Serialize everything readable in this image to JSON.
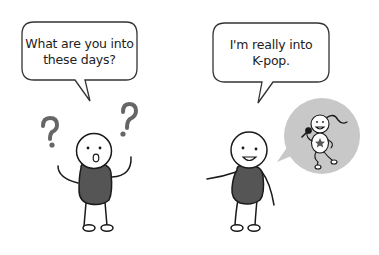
{
  "scene": {
    "left_character": {
      "speech": "What are you into these days?",
      "speech_lines": [
        "What are you into",
        "these days?"
      ],
      "expression": "confused",
      "symbols": [
        "question-mark",
        "question-mark"
      ]
    },
    "right_character": {
      "speech": "I'm really into K-pop.",
      "speech_lines": [
        "I'm really into",
        "K-pop."
      ],
      "expression": "smiling",
      "thought": "k-pop-singer-with-microphone"
    },
    "colors": {
      "outline": "#1a1a1a",
      "body_fill": "#555555",
      "question_mark": "#666666",
      "thought_bubble": "#c8c8c8",
      "background": "#ffffff"
    }
  }
}
